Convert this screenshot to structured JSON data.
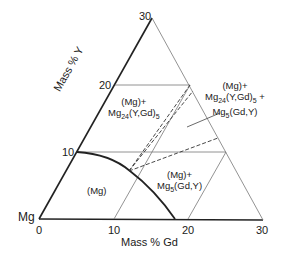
{
  "diagram": {
    "type": "ternary-phase-diagram-section",
    "corner_label": "Mg",
    "x_axis": {
      "label": "Mass % Gd",
      "ticks": [
        "0",
        "10",
        "20",
        "30"
      ]
    },
    "y_axis": {
      "label": "Mass % Y",
      "ticks": [
        "10",
        "20",
        "30"
      ]
    },
    "regions": [
      {
        "id": "mg",
        "line1": "(Mg)",
        "line2": "",
        "line3": ""
      },
      {
        "id": "mg-mg24",
        "line1": "(Mg)+",
        "line2_main": "Mg",
        "line2_sub": "24",
        "line2_rest": "(Y,Gd)",
        "line2_sub2": "5"
      },
      {
        "id": "mg-mg5",
        "line1": "(Mg)+",
        "line2_main": "Mg",
        "line2_sub": "5",
        "line2_rest": "(Gd,Y)"
      },
      {
        "id": "three-phase",
        "line1": "(Mg)+",
        "line2_main": "Mg",
        "line2_sub": "24",
        "line2_rest": "(Y,Gd)",
        "line2_sub2": "5",
        "line2_tail": " +",
        "line3_main": "Mg",
        "line3_sub": "5",
        "line3_rest": "(Gd,Y)"
      }
    ],
    "colors": {
      "line": "#222222",
      "grid": "#777777"
    }
  }
}
